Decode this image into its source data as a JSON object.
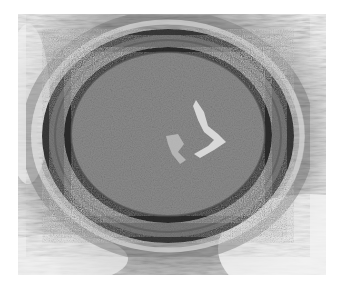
{
  "image": {
    "kind": "histology-micrograph",
    "subject": "cross-section of an artery with concentric wall layers and occluded lumen",
    "colors": {
      "background": "#ffffff",
      "adventitia_light": "#d8d8d8",
      "adventitia_mid": "#a8a8a8",
      "outer_band": "#3a3a3a",
      "media": "#7a7a7a",
      "inner_lamina": "#2e2e2e",
      "lumen": "#8a8a8a",
      "lumen_crack": "#e6e6e6"
    }
  }
}
